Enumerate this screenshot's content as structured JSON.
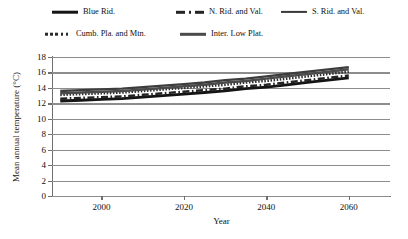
{
  "legend": {
    "items": [
      {
        "label": "Blue Rid.",
        "style": "solid-thick",
        "row": 0,
        "col": 0
      },
      {
        "label": "N. Rid. and Val.",
        "style": "dashdot",
        "row": 0,
        "col": 1
      },
      {
        "label": "S. Rid. and Val.",
        "style": "solid-med",
        "row": 0,
        "col": 2
      },
      {
        "label": "Cumb. Pla. and Mtn.",
        "style": "dotted",
        "row": 1,
        "col": 0
      },
      {
        "label": "Inter. Low Plat.",
        "style": "solid-med2",
        "row": 1,
        "col": 1
      }
    ]
  },
  "chart_data": {
    "type": "line",
    "title": "",
    "xlabel": "Year",
    "ylabel": "Mean annual temperature (°C)",
    "xlim": [
      1988,
      2070
    ],
    "ylim": [
      0,
      18
    ],
    "yticks": [
      0,
      2,
      4,
      6,
      8,
      10,
      12,
      14,
      16,
      18
    ],
    "xticks": [
      2000,
      2020,
      2040,
      2060
    ],
    "grid": true,
    "legend_position": "top",
    "x": [
      1990,
      1995,
      2000,
      2005,
      2010,
      2015,
      2020,
      2025,
      2030,
      2035,
      2040,
      2045,
      2050,
      2055,
      2060
    ],
    "series": [
      {
        "name": "Blue Rid.",
        "style": "solid-thick",
        "values": [
          12.3,
          12.4,
          12.5,
          12.6,
          12.8,
          13.0,
          13.2,
          13.4,
          13.6,
          13.9,
          14.1,
          14.4,
          14.7,
          15.0,
          15.3
        ]
      },
      {
        "name": "N. Rid. and Val.",
        "style": "dashdot",
        "values": [
          12.6,
          12.7,
          12.8,
          12.9,
          13.1,
          13.3,
          13.5,
          13.7,
          13.9,
          14.2,
          14.4,
          14.7,
          15.0,
          15.3,
          15.6
        ]
      },
      {
        "name": "S. Rid. and Val.",
        "style": "solid-med",
        "values": [
          13.6,
          13.7,
          13.8,
          13.9,
          14.1,
          14.3,
          14.5,
          14.7,
          15.0,
          15.2,
          15.5,
          15.8,
          16.1,
          16.4,
          16.7
        ]
      },
      {
        "name": "Cumb. Pla. and Mtn.",
        "style": "dotted",
        "values": [
          13.1,
          13.2,
          13.3,
          13.4,
          13.6,
          13.8,
          14.0,
          14.2,
          14.4,
          14.7,
          14.9,
          15.2,
          15.5,
          15.8,
          16.1
        ]
      },
      {
        "name": "Inter. Low Plat.",
        "style": "solid-med2",
        "values": [
          13.3,
          13.4,
          13.5,
          13.6,
          13.8,
          14.0,
          14.2,
          14.4,
          14.7,
          14.9,
          15.2,
          15.5,
          15.8,
          16.1,
          16.4
        ]
      }
    ]
  }
}
